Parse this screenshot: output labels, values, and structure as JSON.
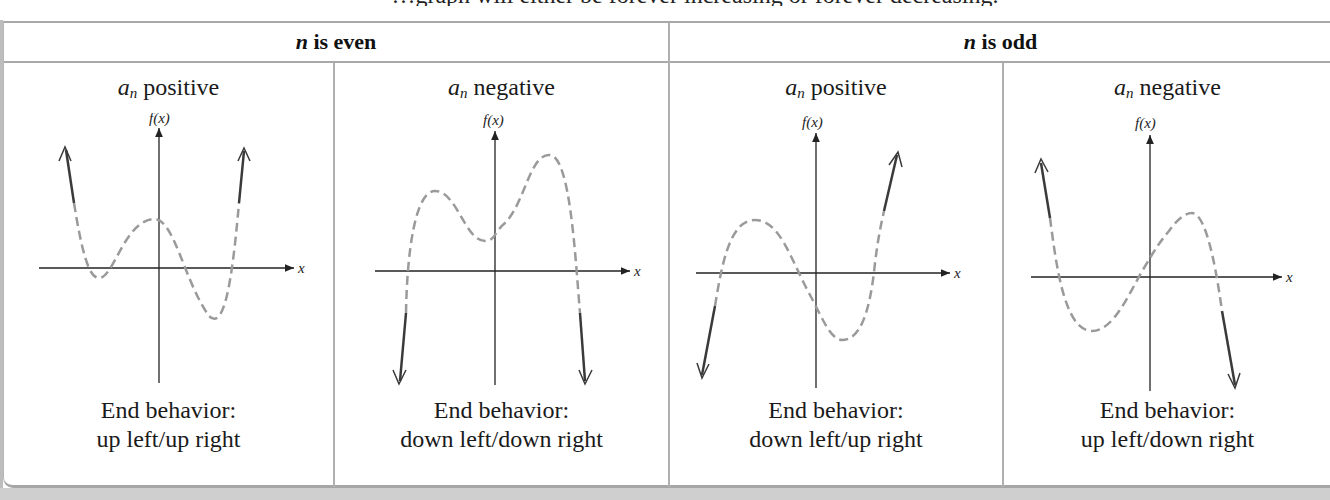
{
  "top_line": "…graph will either be forever increasing or forever decreasing.",
  "header": {
    "even": {
      "var": "n",
      "text": " is even"
    },
    "odd": {
      "var": "n",
      "text": " is odd"
    }
  },
  "cells": [
    {
      "coef": "a",
      "sub": "n",
      "sign": " positive",
      "y_axis_label": "f(x)",
      "x_axis_label": "x",
      "caption_line1": "End behavior:",
      "caption_line2": "up left/up right"
    },
    {
      "coef": "a",
      "sub": "n",
      "sign": " negative",
      "y_axis_label": "f(x)",
      "x_axis_label": "x",
      "caption_line1": "End behavior:",
      "caption_line2": "down left/down right"
    },
    {
      "coef": "a",
      "sub": "n",
      "sign": " positive",
      "y_axis_label": "f(x)",
      "x_axis_label": "x",
      "caption_line1": "End behavior:",
      "caption_line2": "down left/up right"
    },
    {
      "coef": "a",
      "sub": "n",
      "sign": " negative",
      "y_axis_label": "f(x)",
      "x_axis_label": "x",
      "caption_line1": "End behavior:",
      "caption_line2": "up left/down right"
    }
  ],
  "colors": {
    "curve_dashed": "#9a9a9a",
    "curve_solid": "#3a3a3a",
    "axis": "#222222",
    "border": "#a9a9a9"
  }
}
